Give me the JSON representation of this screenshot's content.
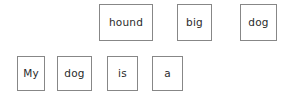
{
  "canvas": {
    "width": 296,
    "height": 99,
    "background_color": "#ffffff",
    "tile_border_color": "#878787",
    "tile_fill_color": "#ffffff",
    "text_color": "#2b2b2b"
  },
  "word_bank": {
    "name": "available-words",
    "tiles": [
      {
        "label": "hound"
      },
      {
        "label": "big"
      },
      {
        "label": "dog"
      }
    ]
  },
  "sentence": {
    "name": "sentence-строка",
    "tiles": [
      {
        "label": "My"
      },
      {
        "label": "dog"
      },
      {
        "label": "is"
      },
      {
        "label": "a"
      }
    ]
  }
}
